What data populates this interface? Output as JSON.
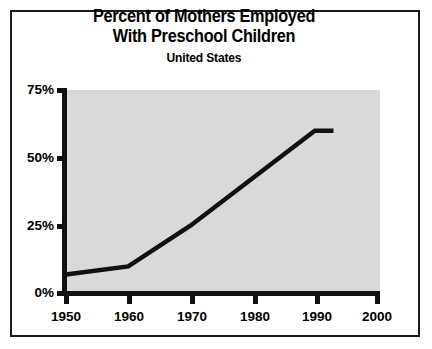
{
  "chart_data": {
    "type": "line",
    "title": "Percent of Mothers Employed With Preschool Children",
    "title_lines": [
      "Percent of Mothers Employed",
      "With Preschool Children"
    ],
    "subtitle": "United States",
    "xlabel": "",
    "ylabel": "",
    "xlim": [
      1950,
      2000
    ],
    "ylim": [
      0,
      75
    ],
    "xticks": [
      1950,
      1960,
      1970,
      1980,
      1990,
      2000
    ],
    "xtick_labels": [
      "1950",
      "1960",
      "1970",
      "1980",
      "1990",
      "2000"
    ],
    "yticks": [
      0,
      25,
      50,
      75
    ],
    "ytick_labels": [
      "0%",
      "25%",
      "50%",
      "75%"
    ],
    "grid": false,
    "legend": false,
    "plot_background": "#d9d9d9",
    "line_color": "#111111",
    "series": [
      {
        "name": "Percent of mothers employed with preschool children",
        "x": [
          1950,
          1960,
          1970,
          1990,
          1993
        ],
        "values": [
          7,
          10,
          25,
          60,
          60
        ]
      }
    ]
  },
  "frame": {
    "border_color": "#1a1a1a",
    "background": "#ffffff"
  }
}
